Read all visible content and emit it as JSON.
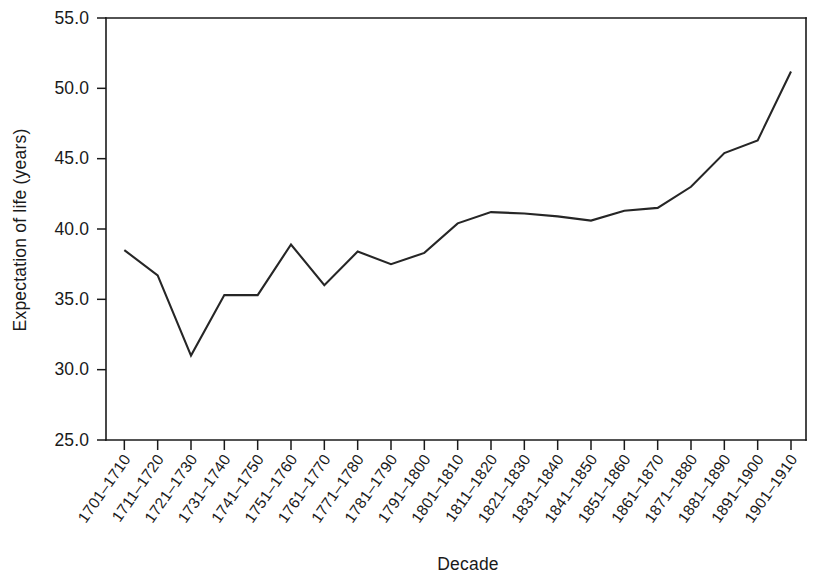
{
  "chart_data": {
    "type": "line",
    "title": "",
    "xlabel": "Decade",
    "ylabel": "Expectation of life (years)",
    "categories": [
      "1701–1710",
      "1711–1720",
      "1721–1730",
      "1731–1740",
      "1741–1750",
      "1751–1760",
      "1761–1770",
      "1771–1780",
      "1781–1790",
      "1791–1800",
      "1801–1810",
      "1811–1820",
      "1821–1830",
      "1831–1840",
      "1841–1850",
      "1851–1860",
      "1861–1870",
      "1871–1880",
      "1881–1890",
      "1891–1900",
      "1901–1910"
    ],
    "values": [
      38.5,
      36.7,
      31.0,
      35.3,
      35.3,
      38.9,
      36.0,
      38.4,
      37.5,
      38.3,
      40.4,
      41.2,
      41.1,
      40.9,
      40.6,
      41.3,
      41.5,
      43.0,
      45.4,
      46.3,
      51.2
    ],
    "ylim": [
      25.0,
      55.0
    ],
    "yticks": [
      25.0,
      30.0,
      35.0,
      40.0,
      45.0,
      50.0,
      55.0
    ],
    "ytick_labels": [
      "25.0",
      "30.0",
      "35.0",
      "40.0",
      "45.0",
      "50.0",
      "55.0"
    ],
    "grid": false,
    "legend": null,
    "line_color": "#262626",
    "axis_color": "#1a1a1a",
    "background_color": "#ffffff"
  }
}
